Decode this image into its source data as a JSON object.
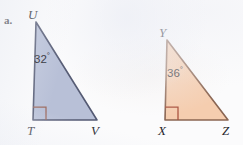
{
  "figure": {
    "part_label": "a.",
    "background_color": "#fbfbfc",
    "triangles": [
      {
        "id": "triangle-utv",
        "fill_color": "#b8c0d7",
        "stroke_color": "#545a73",
        "right_angle_marker_color": "#9c6a5e",
        "vertices": [
          {
            "name": "U",
            "x": 36,
            "y": 22,
            "label_x": 28,
            "label_y": 8
          },
          {
            "name": "T",
            "x": 33,
            "y": 120,
            "label_x": 27,
            "label_y": 124
          },
          {
            "name": "V",
            "x": 97,
            "y": 120,
            "label_x": 91,
            "label_y": 124
          }
        ],
        "angle": {
          "value": "32",
          "degree_symbol": "°",
          "at_vertex": "U",
          "label_x": 34,
          "label_y": 52
        },
        "right_angle_at": "T"
      },
      {
        "id": "triangle-yxz",
        "fill_color": "#f5cdaf",
        "stroke_color": "#8a6552",
        "right_angle_marker_color": "#a8503c",
        "vertices": [
          {
            "name": "Y",
            "x": 167,
            "y": 40,
            "label_x": 159,
            "label_y": 26
          },
          {
            "name": "X",
            "x": 165,
            "y": 120,
            "label_x": 158,
            "label_y": 124
          },
          {
            "name": "Z",
            "x": 228,
            "y": 120,
            "label_x": 222,
            "label_y": 124
          }
        ],
        "angle": {
          "value": "36",
          "degree_symbol": "°",
          "at_vertex": "Y",
          "label_x": 167,
          "label_y": 66
        },
        "right_angle_at": "X"
      }
    ]
  }
}
